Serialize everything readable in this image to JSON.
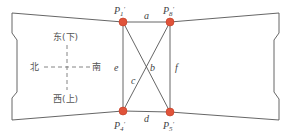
{
  "diagram": {
    "points": [
      {
        "id": "P1",
        "label": "P",
        "sub": "1",
        "prime": "′",
        "x": 123,
        "y": 22
      },
      {
        "id": "P8",
        "label": "P",
        "sub": "8",
        "prime": "′",
        "x": 170,
        "y": 22
      },
      {
        "id": "P4",
        "label": "P",
        "sub": "4",
        "prime": "′",
        "x": 123,
        "y": 111
      },
      {
        "id": "P5",
        "label": "P",
        "sub": "5",
        "prime": "′",
        "x": 170,
        "y": 112
      }
    ],
    "edges": {
      "a": "a",
      "b": "b",
      "c": "c",
      "d": "d",
      "e": "e",
      "f": "f"
    },
    "compass": {
      "north": "北",
      "south": "南",
      "east": "东(下)",
      "west": "西(上)"
    },
    "colors": {
      "point_fill": "#e0533a",
      "point_stroke": "#c03a22",
      "line": "#555555"
    }
  }
}
